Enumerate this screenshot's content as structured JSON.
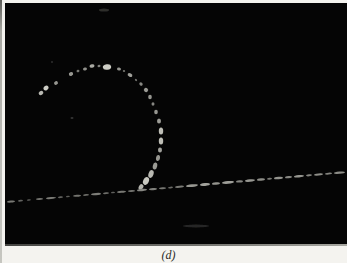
{
  "figure": {
    "caption": "(d)",
    "photo": {
      "background": "#050505",
      "left": 5,
      "top": 3,
      "width": 342,
      "height": 243
    },
    "track_content": {
      "arc_dots": [
        [
          41,
          93,
          2.5,
          2.0,
          -40,
          185
        ],
        [
          46,
          88,
          2.8,
          2.2,
          -40,
          205
        ],
        [
          56,
          83,
          2.0,
          1.8,
          -30,
          150
        ],
        [
          71,
          74,
          2.2,
          1.8,
          -25,
          150
        ],
        [
          78,
          71,
          1.5,
          1.2,
          -20,
          120
        ],
        [
          85,
          69,
          2.0,
          1.5,
          -15,
          145
        ],
        [
          92,
          66,
          2.5,
          1.8,
          -10,
          170
        ],
        [
          99,
          66,
          1.5,
          1.2,
          -5,
          130
        ],
        [
          107,
          67,
          4.2,
          2.8,
          -8,
          205
        ],
        [
          119,
          69,
          2.0,
          1.5,
          10,
          150
        ],
        [
          124,
          71,
          1.2,
          1.0,
          15,
          115
        ],
        [
          130,
          75,
          2.5,
          1.8,
          30,
          160
        ],
        [
          136,
          80,
          1.2,
          1.0,
          35,
          115
        ],
        [
          141,
          84,
          1.8,
          1.5,
          40,
          135
        ],
        [
          146,
          90,
          2.2,
          2.0,
          45,
          155
        ],
        [
          150,
          97,
          1.8,
          2.2,
          0,
          150
        ],
        [
          153,
          104,
          1.5,
          1.8,
          0,
          135
        ],
        [
          156,
          112,
          1.8,
          2.2,
          0,
          150
        ],
        [
          159,
          121,
          2.0,
          2.5,
          0,
          155
        ],
        [
          161,
          131,
          2.2,
          3.5,
          0,
          190
        ],
        [
          161,
          141,
          2.2,
          3.5,
          0,
          190
        ],
        [
          160,
          150,
          2.0,
          2.5,
          5,
          160
        ],
        [
          158,
          158,
          2.0,
          3.0,
          8,
          150
        ],
        [
          155,
          166,
          2.2,
          3.5,
          12,
          155
        ],
        [
          151,
          174,
          2.5,
          4.0,
          18,
          185
        ],
        [
          146,
          181,
          2.8,
          4.0,
          25,
          200
        ],
        [
          141,
          187,
          2.2,
          3.0,
          30,
          180
        ]
      ],
      "beam_line": {
        "x1": 6,
        "y1": 202,
        "x2": 347,
        "y2": 172,
        "dashes": [
          [
            7,
            8,
            2.0,
            120
          ],
          [
            18,
            5,
            1.8,
            100
          ],
          [
            27,
            4,
            1.5,
            92
          ],
          [
            36,
            7,
            2.0,
            112
          ],
          [
            46,
            10,
            2.0,
            122
          ],
          [
            58,
            5,
            1.8,
            100
          ],
          [
            66,
            4,
            1.5,
            92
          ],
          [
            73,
            8,
            2.0,
            115
          ],
          [
            83,
            6,
            1.8,
            105
          ],
          [
            91,
            10,
            2.2,
            125
          ],
          [
            103,
            6,
            1.8,
            110
          ],
          [
            111,
            4,
            1.5,
            95
          ],
          [
            117,
            9,
            2.0,
            120
          ],
          [
            128,
            7,
            2.0,
            112
          ],
          [
            137,
            10,
            2.4,
            135
          ],
          [
            149,
            8,
            2.2,
            128
          ],
          [
            159,
            7,
            2.0,
            118
          ],
          [
            168,
            5,
            1.8,
            106
          ],
          [
            175,
            9,
            2.2,
            122
          ],
          [
            186,
            12,
            2.6,
            152
          ],
          [
            200,
            10,
            2.8,
            162
          ],
          [
            212,
            8,
            2.4,
            148
          ],
          [
            222,
            12,
            2.8,
            158
          ],
          [
            236,
            7,
            2.2,
            132
          ],
          [
            245,
            10,
            2.5,
            152
          ],
          [
            257,
            8,
            2.4,
            142
          ],
          [
            267,
            5,
            2.0,
            122
          ],
          [
            274,
            9,
            2.4,
            148
          ],
          [
            285,
            7,
            2.2,
            136
          ],
          [
            294,
            10,
            2.4,
            150
          ],
          [
            306,
            6,
            2.0,
            132
          ],
          [
            314,
            9,
            2.2,
            142
          ],
          [
            325,
            7,
            2.0,
            132
          ],
          [
            334,
            11,
            2.2,
            142
          ]
        ]
      },
      "specks": [
        [
          104,
          10,
          5.0,
          1.5,
          0,
          45
        ],
        [
          196,
          226,
          13.0,
          1.5,
          0,
          40
        ],
        [
          72,
          118,
          1.5,
          1.0,
          0,
          55
        ],
        [
          52,
          62,
          1.0,
          1.0,
          0,
          45
        ]
      ]
    }
  }
}
